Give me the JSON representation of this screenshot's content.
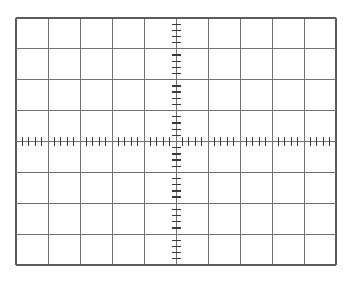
{
  "figure": {
    "kind": "oscilloscope-graticule",
    "canvas": {
      "width": 349,
      "height": 281,
      "background": "#ffffff"
    },
    "grid": {
      "left": 16,
      "top": 18,
      "right": 336,
      "bottom": 265,
      "columns": 10,
      "rows": 8,
      "center_column": 5,
      "center_row": 4,
      "minor_ticks_per_division": 5
    },
    "style": {
      "grid_line_color": "#737373",
      "border_color": "#5c5c5c",
      "tick_color": "#3a3a3a",
      "grid_line_width": 1,
      "border_width": 1.2,
      "tick_width": 1.3,
      "tick_length": 9
    }
  }
}
